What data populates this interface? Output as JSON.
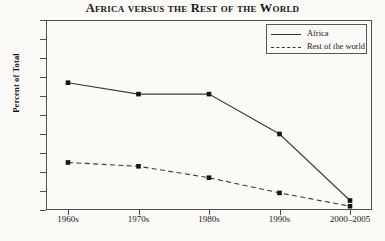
{
  "chart_data": {
    "type": "line",
    "title": "Africa versus the Rest of the World",
    "xlabel": "",
    "ylabel": "Percent of Total",
    "categories": [
      "1960s",
      "1970s",
      "1980s",
      "1990s",
      "2000–2005"
    ],
    "series": [
      {
        "name": "Africa",
        "style": "solid",
        "values": [
          67,
          61,
          61,
          40,
          5
        ]
      },
      {
        "name": "Rest of the world",
        "style": "dashed",
        "values": [
          25,
          23,
          17,
          9,
          2
        ]
      }
    ],
    "ylim": [
      0,
      100
    ],
    "ytick_values": [
      0,
      10,
      20,
      30,
      40,
      50,
      60,
      70,
      80,
      90,
      100
    ],
    "ytick_labels": [
      "0",
      "10",
      "20",
      "30",
      "40",
      "50",
      "60",
      "70",
      "80",
      "90",
      "100"
    ],
    "grid": false,
    "legend_position": "top-right",
    "marker": "square",
    "line_color": "#3a3a38",
    "background_color": "#fbfaf6"
  },
  "legend": {
    "entries": [
      {
        "label": "Africa"
      },
      {
        "label": "Rest of the world"
      }
    ]
  }
}
